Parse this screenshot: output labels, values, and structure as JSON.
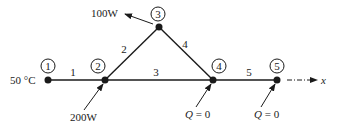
{
  "diagram": {
    "nodes": [
      {
        "id": "1",
        "label": "1"
      },
      {
        "id": "2",
        "label": "2"
      },
      {
        "id": "3",
        "label": "3"
      },
      {
        "id": "4",
        "label": "4"
      },
      {
        "id": "5",
        "label": "5"
      }
    ],
    "elements": [
      {
        "id": "1",
        "label": "1",
        "from": "1",
        "to": "2"
      },
      {
        "id": "2",
        "label": "2",
        "from": "2",
        "to": "3"
      },
      {
        "id": "3",
        "label": "3",
        "from": "2",
        "to": "4"
      },
      {
        "id": "4",
        "label": "4",
        "from": "3",
        "to": "4"
      },
      {
        "id": "5",
        "label": "5",
        "from": "4",
        "to": "5"
      }
    ],
    "boundary": {
      "temperature": "50 °C",
      "heat_in_node2": "200W",
      "heat_out_node3": "100W",
      "q_node4_var": "Q",
      "q_node4_val": " = 0",
      "q_node5_var": "Q",
      "q_node5_val": " = 0"
    },
    "axis_label": "x",
    "line_color": "#1a1a1a"
  }
}
